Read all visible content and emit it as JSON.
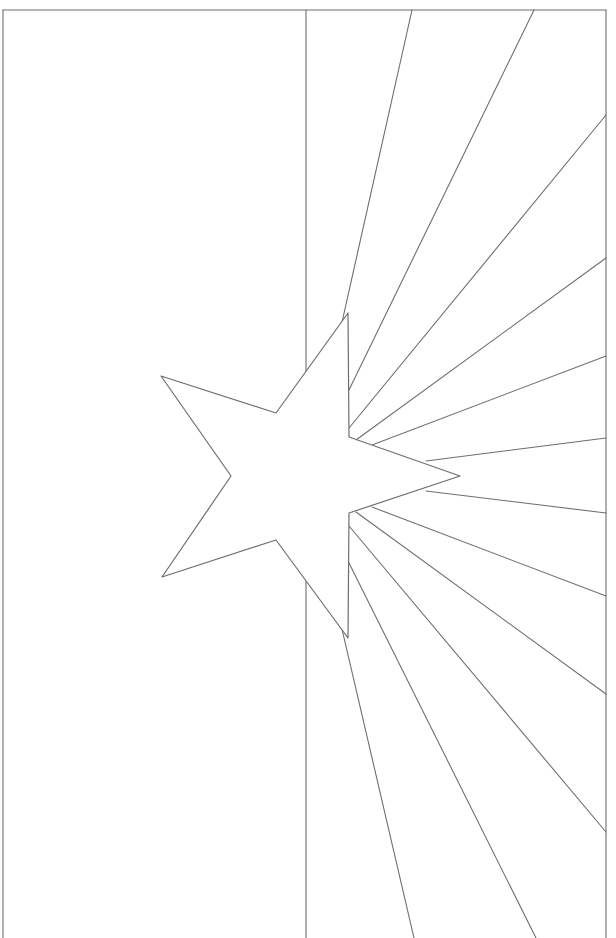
{
  "artwork": {
    "subject": "Arizona flag coloring page (rotated, line art)",
    "stroke_color": "#6e6e6e",
    "background_color": "#ffffff",
    "frame": {
      "left": 3,
      "top": 10,
      "right": 606,
      "bottom": 938
    },
    "divider_x": 306,
    "star": {
      "points": [
        [
          348,
          313
        ],
        [
          349,
          437
        ],
        [
          460,
          476
        ],
        [
          349,
          513
        ],
        [
          348,
          638
        ],
        [
          276,
          540
        ],
        [
          162,
          577
        ],
        [
          231,
          476
        ],
        [
          161,
          376
        ],
        [
          276,
          413
        ]
      ]
    },
    "rays": {
      "origin": [
        350,
        476
      ],
      "endpoints": [
        [
          412,
          10
        ],
        [
          534,
          10
        ],
        [
          606,
          115
        ],
        [
          606,
          258
        ],
        [
          606,
          356
        ],
        [
          606,
          438
        ],
        [
          606,
          513
        ],
        [
          606,
          596
        ],
        [
          606,
          694
        ],
        [
          606,
          832
        ],
        [
          536,
          938
        ],
        [
          414,
          938
        ]
      ],
      "inner_starts": [
        [
          338,
          340
        ],
        [
          348,
          392
        ],
        [
          349,
          428
        ],
        [
          356,
          440
        ],
        [
          372,
          445
        ],
        [
          426,
          461
        ],
        [
          426,
          491
        ],
        [
          372,
          507
        ],
        [
          356,
          512
        ],
        [
          349,
          526
        ],
        [
          349,
          563
        ],
        [
          338,
          612
        ]
      ]
    }
  }
}
